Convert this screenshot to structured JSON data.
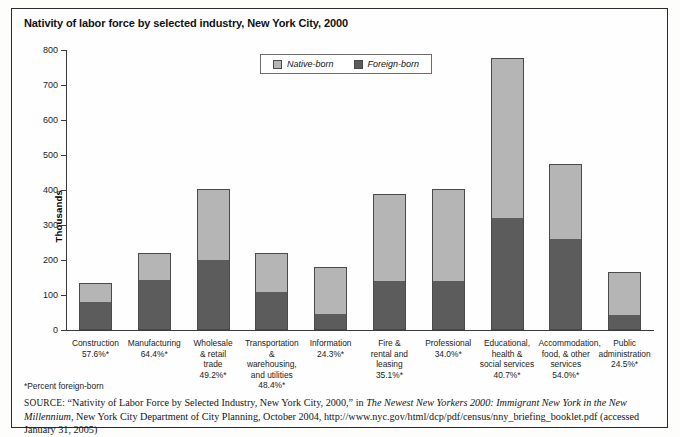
{
  "figure": {
    "title": "Nativity of labor force by selected industry, New York City, 2000",
    "footnote": "*Percent foreign-born",
    "source_kicker": "SOURCE:",
    "source_part1": " “Nativity of Labor Force by Selected Industry, New York City, 2000,” in ",
    "source_italic": "The Newest New Yorkers 2000: Immigrant New York in the New Millennium,",
    "source_part2": " New York City Department of City Planning, October 2004, http://www.nyc.gov/html/dcp/pdf/census/nny_briefing_booklet.pdf (accessed January 31, 2005)"
  },
  "colors": {
    "native": "#b5b5b5",
    "foreign": "#5c5c5c",
    "axis": "#3a3a3a",
    "frame": "#2a2a2a"
  },
  "chart_data": {
    "type": "bar",
    "subtype": "stacked",
    "title": "Nativity of labor force by selected industry, New York City, 2000",
    "xlabel": "",
    "ylabel": "Thousands",
    "ylim": [
      0,
      800
    ],
    "ytick_step": 100,
    "yticks": [
      0,
      100,
      200,
      300,
      400,
      500,
      600,
      700,
      800
    ],
    "ytick_labels": [
      "0",
      "100",
      "200",
      "300",
      "400",
      "500",
      "600",
      "700",
      "800"
    ],
    "grid": false,
    "legend_position": "top-center",
    "legend": [
      "Native-born",
      "Foreign-born"
    ],
    "categories": [
      "Construction",
      "Manufacturing",
      "Wholesale & retail trade",
      "Transportation & warehousing, and utilities",
      "Information",
      "Fire & rental and leasing",
      "Professional",
      "Educational, health & social services",
      "Accommodation, food, & other services",
      "Public administration"
    ],
    "category_lines": [
      [
        "Construction"
      ],
      [
        "Manufacturing"
      ],
      [
        "Wholesale",
        "& retail",
        "trade"
      ],
      [
        "Transportation",
        "& warehousing,",
        "and utilities"
      ],
      [
        "Information"
      ],
      [
        "Fire &",
        "rental and",
        "leasing"
      ],
      [
        "Professional"
      ],
      [
        "Educational,",
        "health &",
        "social services"
      ],
      [
        "Accommodation,",
        "food, & other",
        "services"
      ],
      [
        "Public",
        "administration"
      ]
    ],
    "percent_foreign_labels": [
      "57.6%*",
      "64.4%*",
      "49.2%*",
      "48.4%*",
      "24.3%*",
      "35.1%*",
      "34.0%*",
      "40.7%*",
      "54.0%*",
      "24.5%*"
    ],
    "percent_foreign_values": [
      57.6,
      64.4,
      49.2,
      48.4,
      24.3,
      35.1,
      34.0,
      40.7,
      54.0,
      24.5
    ],
    "totals": [
      134,
      219,
      403,
      219,
      180,
      388,
      404,
      778,
      475,
      167
    ],
    "series": [
      {
        "name": "Foreign-born",
        "color": "#5c5c5c",
        "values": [
          77,
          141,
          198,
          106,
          44,
          136,
          137,
          317,
          257,
          41
        ]
      },
      {
        "name": "Native-born",
        "color": "#b5b5b5",
        "values": [
          57,
          78,
          205,
          113,
          136,
          252,
          267,
          461,
          218,
          126
        ]
      }
    ]
  }
}
